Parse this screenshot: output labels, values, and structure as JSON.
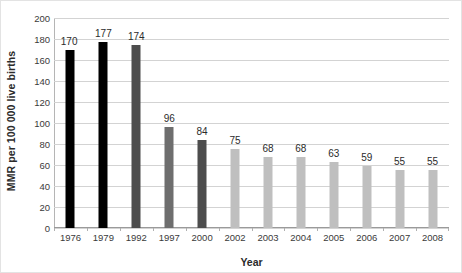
{
  "chart_data": {
    "type": "bar",
    "title": "",
    "subtitle": "",
    "xlabel": "Year",
    "ylabel": "MMR per 100 000 live births",
    "categories": [
      "1976",
      "1979",
      "1992",
      "1997",
      "2000",
      "2002",
      "2003",
      "2004",
      "2005",
      "2006",
      "2007",
      "2008"
    ],
    "values": [
      170,
      177,
      174,
      96,
      84,
      75,
      68,
      68,
      63,
      59,
      55,
      55
    ],
    "bar_colors": [
      "#000000",
      "#000000",
      "#4d4d4d",
      "#6e6e6e",
      "#4d4d4d",
      "#bfbfbf",
      "#bfbfbf",
      "#bfbfbf",
      "#bfbfbf",
      "#bfbfbf",
      "#bfbfbf",
      "#bfbfbf"
    ],
    "data_labels": [
      "170",
      "177",
      "174",
      "96",
      "84",
      "75",
      "68",
      "68",
      "63",
      "59",
      "55",
      "55"
    ],
    "ylim": [
      0,
      200
    ],
    "ytick_step": 20,
    "yticks": [
      "200",
      "180",
      "160",
      "140",
      "120",
      "100",
      "80",
      "60",
      "40",
      "20",
      "0"
    ],
    "grid": true,
    "grid_axis": "y",
    "legend": false,
    "legend_position": "none",
    "gridline_color": "#d3d3d3",
    "axis_color": "#9a9a9a",
    "text_color": "#2b2b2b",
    "background": "#ffffff"
  }
}
